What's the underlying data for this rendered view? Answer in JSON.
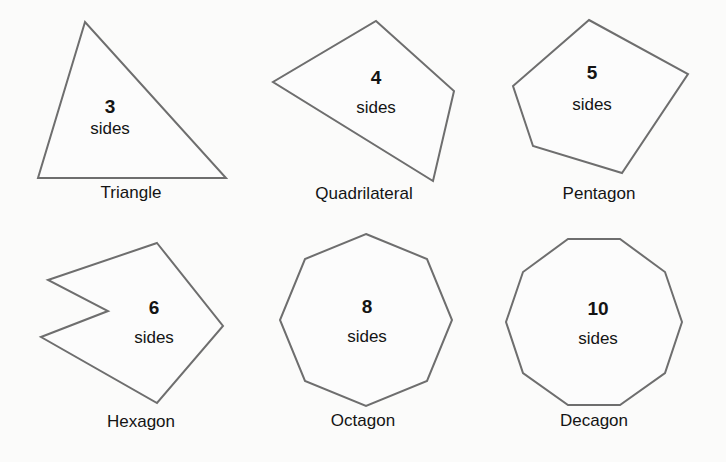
{
  "figure": {
    "background_color": "#fbfbfa",
    "stroke_color": "#6e6e6e",
    "text_color": "#141414",
    "width": 726,
    "height": 462
  },
  "shapes": [
    {
      "id": "triangle",
      "name": "Triangle",
      "count": "3",
      "sides_label": "sides",
      "sides_number": 3,
      "points": "85,22 38,178 226,178",
      "count_pos": {
        "x": 110,
        "y": 107
      },
      "sides_pos": {
        "x": 110,
        "y": 129
      },
      "name_pos": {
        "x": 131,
        "y": 183
      }
    },
    {
      "id": "quadrilateral",
      "name": "Quadrilateral",
      "count": "4",
      "sides_label": "sides",
      "sides_number": 4,
      "points": "376,21 454,91 433,181 273,82",
      "count_pos": {
        "x": 376,
        "y": 78
      },
      "sides_pos": {
        "x": 376,
        "y": 108
      },
      "name_pos": {
        "x": 364,
        "y": 184
      }
    },
    {
      "id": "pentagon",
      "name": "Pentagon",
      "count": "5",
      "sides_label": "sides",
      "sides_number": 5,
      "points": "589,20 688,74 622,173 533,146 513,86",
      "count_pos": {
        "x": 592,
        "y": 73
      },
      "sides_pos": {
        "x": 592,
        "y": 105
      },
      "name_pos": {
        "x": 599,
        "y": 184
      }
    },
    {
      "id": "hexagon",
      "name": "Hexagon",
      "count": "6",
      "sides_label": "sides",
      "sides_number": 6,
      "points": "157,243 223,326 157,403 41,337 108,311 48,280",
      "count_pos": {
        "x": 154,
        "y": 308
      },
      "sides_pos": {
        "x": 154,
        "y": 338
      },
      "name_pos": {
        "x": 141,
        "y": 412
      }
    },
    {
      "id": "octagon",
      "name": "Octagon",
      "count": "8",
      "sides_label": "sides",
      "sides_number": 8,
      "points": "366,234 427,259 452,320 427,381 366,406 305,381 280,320 305,259",
      "count_pos": {
        "x": 367,
        "y": 307
      },
      "sides_pos": {
        "x": 367,
        "y": 337
      },
      "name_pos": {
        "x": 363,
        "y": 411
      }
    },
    {
      "id": "decagon",
      "name": "Decagon",
      "count": "10",
      "sides_label": "sides",
      "sides_number": 10,
      "points": "568,239 620,239 665,272 682,322 665,373 620,405 568,405 523,373 506,322 523,272",
      "count_pos": {
        "x": 598,
        "y": 309
      },
      "sides_pos": {
        "x": 598,
        "y": 339
      },
      "name_pos": {
        "x": 594,
        "y": 411
      }
    }
  ]
}
